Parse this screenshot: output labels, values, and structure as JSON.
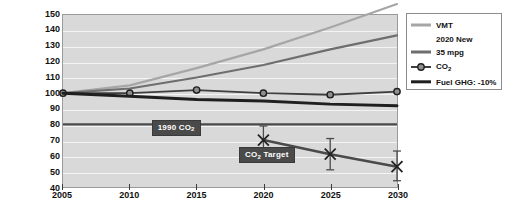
{
  "title_strip": "",
  "chart_data": {
    "type": "line",
    "title": "",
    "xlabel": "",
    "ylabel": "Index: 2005=100%",
    "x": [
      2005,
      2010,
      2015,
      2020,
      2025,
      2030
    ],
    "xlim": [
      2005,
      2030
    ],
    "ylim": [
      40,
      150
    ],
    "xticks": [
      "2005",
      "2010",
      "2015",
      "2020",
      "2025",
      "2030"
    ],
    "yticks": [
      "150",
      "140",
      "130",
      "120",
      "110",
      "100",
      "90",
      "80",
      "70",
      "60",
      "50",
      "40"
    ],
    "grid": true,
    "legend_position": "top-right",
    "series": [
      {
        "name": "VMT",
        "key": "vmt",
        "color": "#a6a6a6",
        "width": 2.2,
        "marker": "none",
        "values": [
          100,
          105,
          116,
          128,
          142,
          157
        ]
      },
      {
        "name": "2020 New 35 mpg",
        "key": "mpg35",
        "label_line1": "2020 New",
        "label_line2": "35 mpg",
        "color": "#6e6e6e",
        "width": 2.2,
        "marker": "none",
        "values": [
          100,
          103,
          110,
          118,
          128,
          137
        ]
      },
      {
        "name": "CO2",
        "key": "co2",
        "color": "#3f3f3f",
        "width": 1.8,
        "marker": "circle",
        "values": [
          100,
          100,
          102,
          100,
          99,
          101
        ]
      },
      {
        "name": "Fuel GHG: -10%",
        "key": "fuelghg",
        "color": "#1f1f1f",
        "width": 3.0,
        "marker": "none",
        "values": [
          100,
          98,
          96,
          95,
          93,
          92
        ]
      },
      {
        "name": "CO2 Target",
        "key": "co2target",
        "color": "#4a4a4a",
        "width": 2.6,
        "marker": "x",
        "x": [
          2020,
          2025,
          2030
        ],
        "values": [
          70,
          61,
          53
        ],
        "error_high": [
          79,
          71,
          63
        ],
        "error_low": [
          62,
          51,
          44
        ]
      },
      {
        "name": "1990 CO2",
        "key": "co2_1990",
        "color": "#4a4a4a",
        "width": 2.2,
        "marker": "none",
        "constant": 80
      }
    ],
    "annotations": [
      {
        "key": "a1990",
        "text": "1990 CO",
        "sub": "2",
        "x": 2011.6,
        "y": 80
      },
      {
        "key": "atarget",
        "text": "CO",
        "sub": "2",
        "text2": " Target",
        "x": 2018.1,
        "y": 62.5
      }
    ]
  },
  "legend": {
    "items": [
      {
        "label": "VMT",
        "sub": "",
        "tail": ""
      },
      {
        "label": "2020 New",
        "label2": "35 mpg",
        "sub": "",
        "tail": ""
      },
      {
        "label": "CO",
        "sub": "2",
        "tail": ""
      },
      {
        "label": "Fuel GHG: -10%",
        "sub": "",
        "tail": ""
      }
    ]
  }
}
